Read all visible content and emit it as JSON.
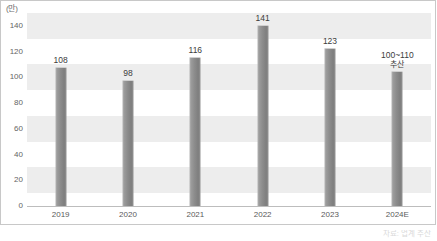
{
  "chart_data": {
    "type": "bar",
    "title": "",
    "subtitle": "",
    "unit_label": "(만)",
    "xlabel": "",
    "ylabel": "",
    "ylim": [
      0,
      150
    ],
    "yticks": [
      0,
      20,
      40,
      60,
      80,
      100,
      120,
      140
    ],
    "ytick_labels": [
      "0",
      "20",
      "40",
      "60",
      "80",
      "100",
      "120",
      "140"
    ],
    "grid": "horizontal-bands",
    "legend": "none",
    "categories": [
      "2019",
      "2020",
      "2021",
      "2022",
      "2023",
      "2024E"
    ],
    "values": [
      108,
      98,
      116,
      141,
      123,
      105
    ],
    "data_labels": [
      "108",
      "98",
      "116",
      "141",
      "123",
      "100~110"
    ],
    "annotations": [
      {
        "category": "2024E",
        "text": "100~110",
        "sub_text": "추산"
      }
    ],
    "bar_color": "#8c8c8c",
    "band_color": "#ededed",
    "axis_color": "#bdbdbd",
    "label_color": "#3c3c3c"
  },
  "caption": {
    "text": "자료: 업계 추산"
  }
}
